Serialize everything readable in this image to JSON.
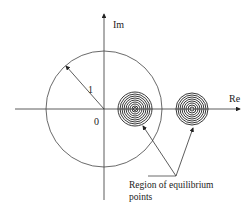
{
  "diagram": {
    "axes": {
      "x_label": "Re",
      "y_label": "Im",
      "origin_label": "0"
    },
    "unit_circle": {
      "radius_label": "1"
    },
    "regions": [
      {
        "name": "equilibrium-region-inside",
        "center": "inside unit circle"
      },
      {
        "name": "equilibrium-region-outside",
        "center": "outside unit circle"
      }
    ],
    "annotation": {
      "line1": "Region of equilibrium",
      "line2": "points"
    }
  }
}
